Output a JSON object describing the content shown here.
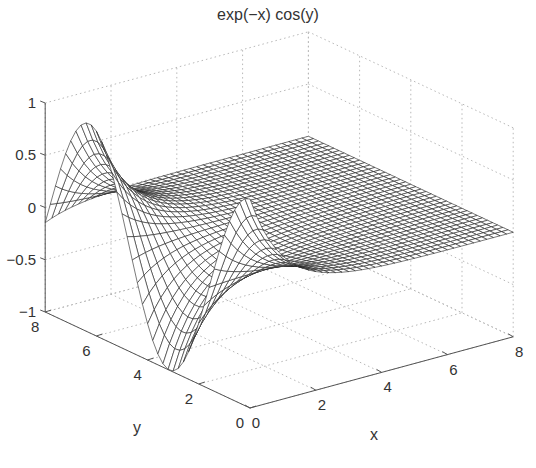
{
  "chart_data": {
    "type": "mesh3d",
    "title": "exp(−x) cos(y)",
    "function": "z = exp(-x) * cos(y)",
    "xlabel": "x",
    "ylabel": "y",
    "zlabel": "",
    "xlim": [
      0,
      8
    ],
    "ylim": [
      0,
      8
    ],
    "zlim": [
      -1,
      1
    ],
    "x_ticks": [
      "0",
      "2",
      "4",
      "6",
      "8"
    ],
    "y_ticks": [
      "0",
      "2",
      "4",
      "6",
      "8"
    ],
    "z_ticks": [
      "−1",
      "−0.5",
      "0",
      "0.5",
      "1"
    ],
    "grid": true,
    "grid_style": "dotted",
    "mesh_color": "#000000",
    "face_color": "#ffffff",
    "samples": {
      "x_steps": 40,
      "y_steps": 40
    },
    "key_points": [
      {
        "x": 0,
        "y": 0,
        "z": 1.0
      },
      {
        "x": 0,
        "y": 3.14,
        "z": -1.0
      },
      {
        "x": 0,
        "y": 6.28,
        "z": 1.0
      },
      {
        "x": 0,
        "y": 8,
        "z": -0.146
      },
      {
        "x": 8,
        "y": 0,
        "z": 0.0003
      }
    ]
  }
}
